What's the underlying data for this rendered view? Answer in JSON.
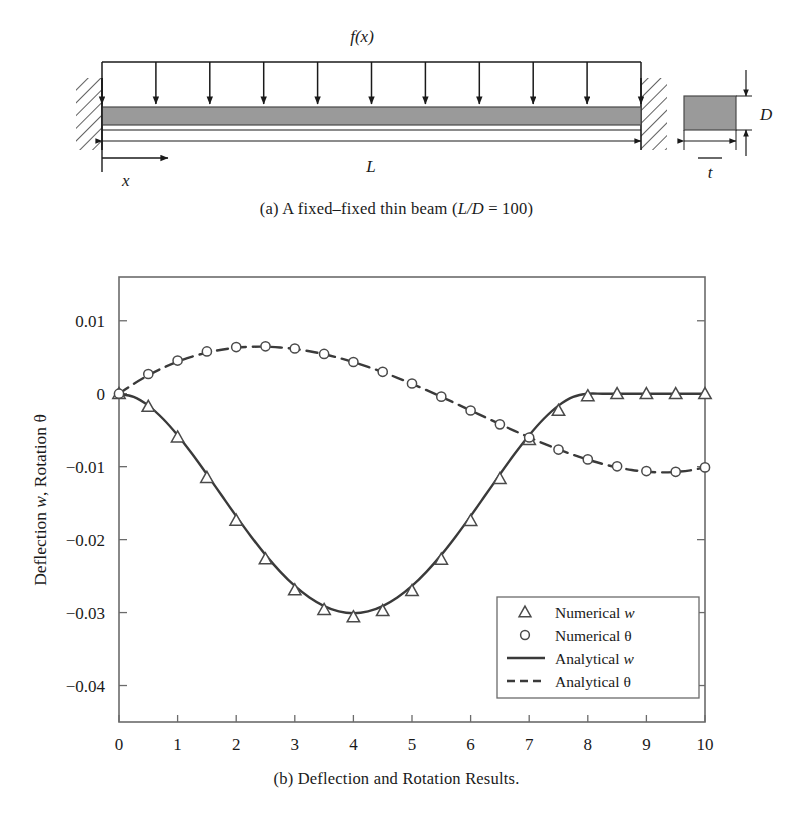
{
  "figure": {
    "panel_a": {
      "caption_prefix": "(a)",
      "caption_text": "A fixed–fixed thin beam (",
      "caption_ratio": "L/D",
      "caption_equals": " = 100)",
      "labels": {
        "load": "f(x)",
        "length": "L",
        "coordinate": "x",
        "depth": "D",
        "thickness": "t"
      },
      "load_arrow_count": 11,
      "support": "fixed-fixed",
      "beam_fill": "#9a9a9a",
      "line_color": "#1a1a1a"
    },
    "panel_b": {
      "caption": "(b) Deflection and Rotation Results."
    }
  },
  "chart_data": {
    "type": "line",
    "title": "",
    "xlabel": "",
    "ylabel": "Deflection w, Rotation θ",
    "ylabel_parts": {
      "pre": "Deflection ",
      "italic1": "w",
      "mid": ", Rotation ",
      "sym": "θ"
    },
    "xlim": [
      0,
      10
    ],
    "ylim": [
      -0.045,
      0.016
    ],
    "xticks": [
      0,
      1,
      2,
      3,
      4,
      5,
      6,
      7,
      8,
      9,
      10
    ],
    "xtick_labels": [
      "0",
      "1",
      "2",
      "3",
      "4",
      "5",
      "6",
      "7",
      "8",
      "9",
      "10"
    ],
    "yticks": [
      0.01,
      0,
      -0.01,
      -0.02,
      -0.03,
      -0.04
    ],
    "ytick_labels": [
      "0.01",
      "0",
      "−0.01",
      "−0.02",
      "−0.03",
      "−0.04"
    ],
    "grid": false,
    "frame": true,
    "legend_position": "lower right",
    "legend": [
      {
        "label_pre": "Numerical ",
        "label_sym": "w",
        "marker": "triangle",
        "style": "marker"
      },
      {
        "label_pre": "Numerical ",
        "label_sym": "θ",
        "marker": "circle",
        "style": "marker"
      },
      {
        "label_pre": "Analytical ",
        "label_sym": "w",
        "marker": "none",
        "style": "solid"
      },
      {
        "label_pre": "Analytical ",
        "label_sym": "θ",
        "marker": "none",
        "style": "dashed"
      }
    ],
    "series": [
      {
        "name": "Analytical w",
        "style": "solid",
        "color": "#3a3a3a",
        "x": [
          0,
          0.25,
          0.5,
          0.75,
          1,
          1.25,
          1.5,
          1.75,
          2,
          2.25,
          2.5,
          2.75,
          3,
          3.25,
          3.5,
          3.75,
          4,
          4.25,
          4.5,
          4.75,
          5,
          5.25,
          5.5,
          5.75,
          6,
          6.25,
          6.5,
          6.75,
          7,
          7.25,
          7.5,
          7.75,
          8,
          8.25,
          8.5,
          8.75,
          9,
          9.25,
          9.5,
          9.75,
          10
        ],
        "y": [
          0,
          -0.00044,
          -0.00163,
          -0.00343,
          -0.00569,
          -0.00827,
          -0.01105,
          -0.01392,
          -0.01678,
          -0.01953,
          -0.02209,
          -0.02438,
          -0.02635,
          -0.02794,
          -0.02911,
          -0.02984,
          -0.03009,
          -0.02984,
          -0.02911,
          -0.02794,
          -0.02635,
          -0.02438,
          -0.02209,
          -0.01953,
          -0.01678,
          -0.01392,
          -0.01105,
          -0.00827,
          -0.00569,
          -0.00343,
          -0.00163,
          -0.00044,
          0,
          0,
          0,
          0,
          0,
          0,
          0,
          0,
          0
        ]
      },
      {
        "name": "Analytical theta",
        "style": "dashed",
        "color": "#3a3a3a",
        "x": [
          0,
          0.25,
          0.5,
          0.75,
          1,
          1.25,
          1.5,
          1.75,
          2,
          2.25,
          2.5,
          2.75,
          3,
          3.25,
          3.5,
          3.75,
          4,
          4.25,
          4.5,
          4.75,
          5,
          5.25,
          5.5,
          5.75,
          6,
          6.25,
          6.5,
          6.75,
          7,
          7.25,
          7.5,
          7.75,
          8,
          8.25,
          8.5,
          8.75,
          9,
          9.25,
          9.5,
          9.75,
          10
        ],
        "y": [
          0,
          0.00135,
          0.00253,
          0.00354,
          0.00439,
          0.00509,
          0.00563,
          0.00603,
          0.0063,
          0.00643,
          0.00645,
          0.00634,
          0.00613,
          0.00582,
          0.00541,
          0.00491,
          0.00433,
          0.00368,
          0.00296,
          0.00218,
          0.00135,
          0.00048,
          -0.00042,
          -0.00135,
          -0.00229,
          -0.00323,
          -0.00417,
          -0.00509,
          -0.00598,
          -0.00684,
          -0.00764,
          -0.00838,
          -0.00904,
          -0.00962,
          -0.01009,
          -0.01045,
          -0.01069,
          -0.01078,
          -0.01072,
          -0.0105,
          -0.0101
        ]
      }
    ],
    "markers": [
      {
        "name": "Numerical w",
        "marker": "triangle",
        "color": "#4a4a4a",
        "x": [
          0,
          0.5,
          1,
          1.5,
          2,
          2.5,
          3,
          3.5,
          4,
          4.5,
          5,
          5.5,
          6,
          6.5,
          7,
          7.5,
          8,
          8.5,
          9,
          9.5,
          10
        ],
        "y": [
          0,
          -0.00175,
          -0.00595,
          -0.0115,
          -0.01735,
          -0.02265,
          -0.0269,
          -0.0296,
          -0.0306,
          -0.02975,
          -0.027,
          -0.0227,
          -0.0174,
          -0.01165,
          -0.0063,
          -0.0023,
          -0.0003,
          0,
          0,
          0,
          0
        ]
      },
      {
        "name": "Numerical theta",
        "marker": "circle",
        "color": "#4a4a4a",
        "x": [
          0,
          0.5,
          1,
          1.5,
          2,
          2.5,
          3,
          3.5,
          4,
          4.5,
          5,
          5.5,
          6,
          6.5,
          7,
          7.5,
          8,
          8.5,
          9,
          9.5,
          10
        ],
        "y": [
          0,
          0.0027,
          0.00455,
          0.0058,
          0.0064,
          0.0065,
          0.0062,
          0.00545,
          0.00435,
          0.003,
          0.0014,
          -0.0004,
          -0.0023,
          -0.0042,
          -0.006,
          -0.00765,
          -0.009,
          -0.00995,
          -0.0106,
          -0.0107,
          -0.0101
        ]
      }
    ]
  }
}
